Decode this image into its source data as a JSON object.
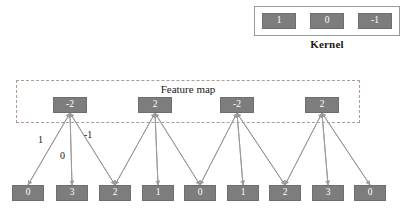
{
  "kernel": {
    "title": "Kernel",
    "values": [
      "1",
      "0",
      "-1"
    ]
  },
  "feature_map": {
    "title": "Feature map",
    "values": [
      "-2",
      "2",
      "-2",
      "2"
    ]
  },
  "input_row": {
    "values": [
      "0",
      "3",
      "2",
      "1",
      "0",
      "1",
      "2",
      "3",
      "0"
    ]
  },
  "edge_weights": [
    {
      "label": "1",
      "x": 38,
      "y": 134
    },
    {
      "label": "0",
      "x": 60,
      "y": 150
    },
    {
      "label": "-1",
      "x": 84,
      "y": 129
    }
  ],
  "colors": {
    "cell_fill": "#7d7d7d",
    "cell_text": "#ffffff",
    "kernel_border": "#9a9a9a",
    "feature_map_border": "#b09a8e",
    "edge_stroke": "#9b9b9b",
    "background": "#ffffff"
  },
  "chart_data": {
    "type": "diagram",
    "kernel": [
      1,
      0,
      -1
    ],
    "input": [
      0,
      3,
      2,
      1,
      0,
      1,
      2,
      3,
      0
    ],
    "feature_map": [
      -2,
      2,
      -2,
      2
    ],
    "feature_node_x": [
      70,
      155,
      237,
      322
    ],
    "input_node_x": [
      28,
      72,
      115,
      158,
      200,
      243,
      285,
      328,
      370
    ],
    "feature_node_y": 105,
    "input_node_y": 193,
    "connections": [
      {
        "feature_index": 0,
        "input_indices": [
          0,
          1,
          2
        ],
        "weights": [
          1,
          0,
          -1
        ]
      },
      {
        "feature_index": 1,
        "input_indices": [
          2,
          3,
          4
        ],
        "weights": [
          1,
          0,
          -1
        ]
      },
      {
        "feature_index": 2,
        "input_indices": [
          4,
          5,
          6
        ],
        "weights": [
          1,
          0,
          -1
        ]
      },
      {
        "feature_index": 3,
        "input_indices": [
          6,
          7,
          8
        ],
        "weights": [
          1,
          0,
          -1
        ]
      }
    ]
  }
}
